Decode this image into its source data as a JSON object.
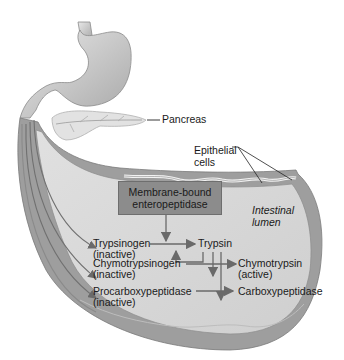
{
  "figure": {
    "labels": {
      "pancreas": "Pancreas",
      "epithelial": [
        "Epithelial",
        "cells"
      ],
      "lumen": [
        "Intestinal",
        "lumen"
      ],
      "enzyme_box": [
        "Membrane-bound",
        "enteropeptidase"
      ],
      "trypsinogen": [
        "Trypsinogen",
        "(inactive)"
      ],
      "trypsin": "Trypsin",
      "chymotrypsinogen": [
        "Chymotrypsinogen",
        "(inactive)"
      ],
      "chymotrypsin": [
        "Chymotrypsin",
        "(active)"
      ],
      "procarboxypeptidase": [
        "Procarboxypeptidase",
        "(inactive)"
      ],
      "carboxypeptidase": "Carboxypeptidase"
    },
    "colors": {
      "organ_fill": "#d4d4d4",
      "organ_dark": "#9a9a9a",
      "box_fill": "#8c8c8c",
      "arrow": "#6a6a6a",
      "text": "#1a1a1a"
    }
  }
}
